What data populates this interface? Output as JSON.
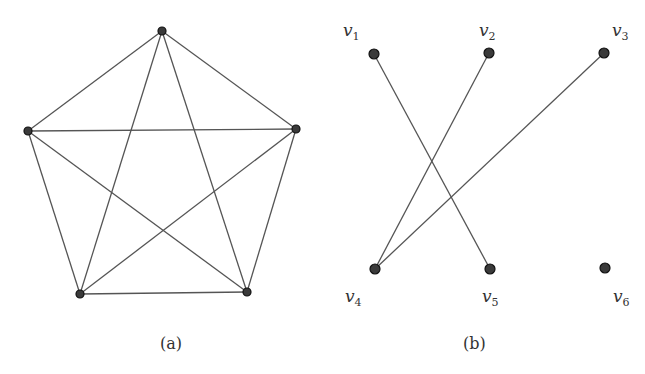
{
  "figure_a": {
    "caption": "(a)",
    "graph": "K5",
    "nodes": [
      {
        "id": "a1",
        "x": 162,
        "y": 31
      },
      {
        "id": "a2",
        "x": 28,
        "y": 131
      },
      {
        "id": "a3",
        "x": 296,
        "y": 129
      },
      {
        "id": "a4",
        "x": 80,
        "y": 294
      },
      {
        "id": "a5",
        "x": 247,
        "y": 292
      }
    ],
    "edges": [
      [
        "a1",
        "a2"
      ],
      [
        "a1",
        "a3"
      ],
      [
        "a1",
        "a4"
      ],
      [
        "a1",
        "a5"
      ],
      [
        "a2",
        "a3"
      ],
      [
        "a2",
        "a4"
      ],
      [
        "a2",
        "a5"
      ],
      [
        "a3",
        "a4"
      ],
      [
        "a3",
        "a5"
      ],
      [
        "a4",
        "a5"
      ]
    ]
  },
  "figure_b": {
    "caption": "(b)",
    "nodes": [
      {
        "id": "v1",
        "label": "v",
        "sub": "1",
        "x": 374,
        "y": 54
      },
      {
        "id": "v2",
        "label": "v",
        "sub": "2",
        "x": 489,
        "y": 53
      },
      {
        "id": "v3",
        "label": "v",
        "sub": "3",
        "x": 604,
        "y": 53
      },
      {
        "id": "v4",
        "label": "v",
        "sub": "4",
        "x": 375,
        "y": 269
      },
      {
        "id": "v5",
        "label": "v",
        "sub": "5",
        "x": 490,
        "y": 269
      },
      {
        "id": "v6",
        "label": "v",
        "sub": "6",
        "x": 605,
        "y": 268
      }
    ],
    "edges": [
      [
        "v1",
        "v5"
      ],
      [
        "v2",
        "v4"
      ],
      [
        "v3",
        "v4"
      ]
    ]
  }
}
